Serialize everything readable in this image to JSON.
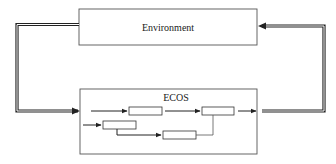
{
  "diagram": {
    "type": "block-diagram",
    "nodes": {
      "environment": {
        "label": "Environment"
      },
      "ecos": {
        "label": "ECOS"
      },
      "inner_blocks": [
        {
          "id": "block-a",
          "label": ""
        },
        {
          "id": "block-b",
          "label": ""
        },
        {
          "id": "block-c",
          "label": ""
        },
        {
          "id": "block-d",
          "label": ""
        }
      ]
    },
    "edges": [
      {
        "from": "environment",
        "to": "ecos",
        "style": "double-line",
        "direction": "left-loop"
      },
      {
        "from": "ecos",
        "to": "environment",
        "style": "double-line",
        "direction": "right-loop"
      },
      {
        "from": "ecos-input",
        "to": "block-a"
      },
      {
        "from": "block-a",
        "to": "block-b"
      },
      {
        "from": "block-b",
        "to": "ecos-output"
      },
      {
        "from": "ecos-input",
        "to": "block-c"
      },
      {
        "from": "block-c",
        "to": "block-d"
      },
      {
        "from": "block-d",
        "to": "block-b",
        "style": "line"
      }
    ],
    "colors": {
      "line": "#2b2b2b",
      "box_border": "#555555",
      "background": "#ffffff"
    }
  }
}
